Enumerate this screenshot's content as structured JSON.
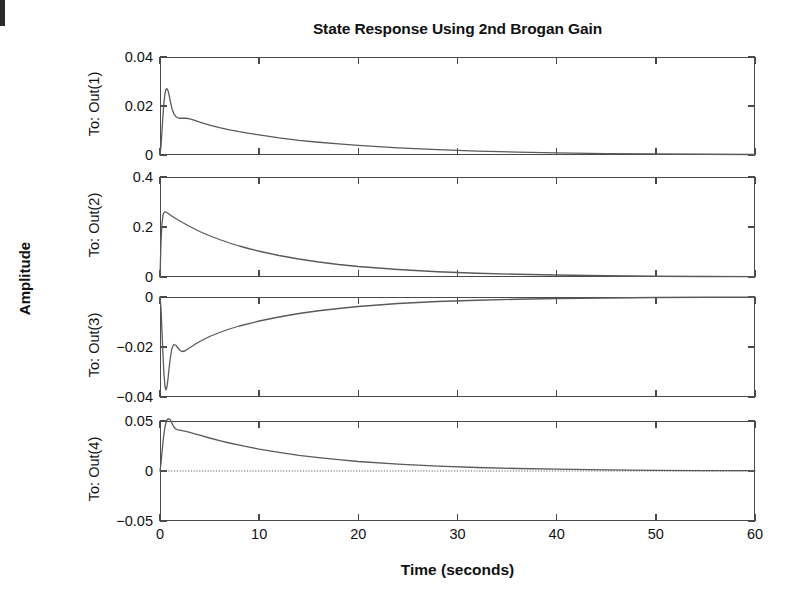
{
  "figure": {
    "title": "State Response Using 2nd Brogan Gain",
    "ylabel": "Amplitude",
    "xlabel": "Time (seconds)"
  },
  "chart_data": {
    "type": "line",
    "title": "State Response Using 2nd Brogan Gain",
    "xlabel": "Time (seconds)",
    "ylabel": "Amplitude",
    "xlim": [
      0,
      60
    ],
    "xticks": [
      0,
      10,
      20,
      30,
      40,
      50,
      60
    ],
    "xticklabels": [
      "0",
      "10",
      "20",
      "30",
      "40",
      "50",
      "60"
    ],
    "grid": false,
    "legend": null,
    "line_color": "#5a5a5a",
    "subplots": [
      {
        "name": "To: Out(1)",
        "ylabel": "To: Out(1)",
        "ylim": [
          0,
          0.04
        ],
        "yticks": [
          0,
          0.02,
          0.04
        ],
        "yticklabels": [
          "0",
          "0.02",
          "0.04"
        ],
        "zero_line": false,
        "x": [
          0,
          0.1,
          0.2,
          0.3,
          0.4,
          0.5,
          0.6,
          0.7,
          0.8,
          0.9,
          1.0,
          1.2,
          1.4,
          1.6,
          1.8,
          2.0,
          2.2,
          2.4,
          2.6,
          2.8,
          3.0,
          3.5,
          4.0,
          5.0,
          6.0,
          7.0,
          8.0,
          9.0,
          10.0,
          12.0,
          14.0,
          16.0,
          18.0,
          20.0,
          24.0,
          28.0,
          32.0,
          36.0,
          40.0,
          45.0,
          50.0,
          55.0,
          60.0
        ],
        "y": [
          0.0,
          0.0035,
          0.0098,
          0.0163,
          0.0215,
          0.0251,
          0.0268,
          0.0271,
          0.0264,
          0.0248,
          0.0228,
          0.019,
          0.0168,
          0.0157,
          0.0152,
          0.015,
          0.015,
          0.015,
          0.015,
          0.0149,
          0.0147,
          0.0141,
          0.0134,
          0.0122,
          0.0112,
          0.0103,
          0.0095,
          0.0088,
          0.0082,
          0.007,
          0.006,
          0.0052,
          0.0045,
          0.0039,
          0.0029,
          0.0022,
          0.0016,
          0.0012,
          0.0009,
          0.0006,
          0.0004,
          0.0003,
          0.0002
        ]
      },
      {
        "name": "To: Out(2)",
        "ylabel": "To: Out(2)",
        "ylim": [
          0,
          0.4
        ],
        "yticks": [
          0,
          0.2,
          0.4
        ],
        "yticklabels": [
          "0",
          "0.2",
          "0.4"
        ],
        "zero_line": false,
        "x": [
          0,
          0.1,
          0.2,
          0.3,
          0.4,
          0.5,
          0.7,
          0.9,
          1.0,
          1.5,
          2.0,
          2.5,
          3.0,
          3.5,
          4.0,
          5.0,
          6.0,
          7.0,
          8.0,
          9.0,
          10.0,
          12.0,
          14.0,
          16.0,
          18.0,
          20.0,
          24.0,
          28.0,
          32.0,
          36.0,
          40.0,
          45.0,
          50.0,
          55.0,
          60.0
        ],
        "y": [
          0.0,
          0.14,
          0.215,
          0.248,
          0.258,
          0.261,
          0.258,
          0.252,
          0.249,
          0.236,
          0.224,
          0.213,
          0.202,
          0.192,
          0.182,
          0.165,
          0.15,
          0.136,
          0.124,
          0.113,
          0.103,
          0.086,
          0.072,
          0.06,
          0.05,
          0.042,
          0.03,
          0.021,
          0.015,
          0.011,
          0.008,
          0.005,
          0.003,
          0.002,
          0.0012
        ]
      },
      {
        "name": "To: Out(3)",
        "ylabel": "To: Out(3)",
        "ylim": [
          -0.04,
          0
        ],
        "yticks": [
          0,
          -0.02,
          -0.04
        ],
        "yticklabels": [
          "0",
          "−0.02",
          "−0.04"
        ],
        "zero_line": false,
        "x": [
          0,
          0.1,
          0.2,
          0.3,
          0.4,
          0.5,
          0.6,
          0.7,
          0.8,
          0.9,
          1.0,
          1.2,
          1.4,
          1.6,
          1.8,
          2.0,
          2.2,
          2.5,
          2.8,
          3.0,
          3.5,
          4.0,
          5.0,
          6.0,
          7.0,
          8.0,
          10.0,
          12.0,
          14.0,
          16.0,
          18.0,
          20.0,
          24.0,
          28.0,
          32.0,
          36.0,
          40.0,
          45.0,
          50.0,
          55.0,
          60.0
        ],
        "y": [
          0.0,
          -0.0045,
          -0.0135,
          -0.0232,
          -0.031,
          -0.0357,
          -0.0372,
          -0.036,
          -0.033,
          -0.0292,
          -0.0255,
          -0.0205,
          -0.019,
          -0.0193,
          -0.0203,
          -0.0213,
          -0.0218,
          -0.0216,
          -0.0208,
          -0.0203,
          -0.019,
          -0.0178,
          -0.0158,
          -0.0142,
          -0.0128,
          -0.0116,
          -0.0096,
          -0.008,
          -0.0066,
          -0.0055,
          -0.0046,
          -0.0038,
          -0.0026,
          -0.0018,
          -0.0013,
          -0.0009,
          -0.0006,
          -0.0004,
          -0.0002,
          -0.0001,
          -5e-05
        ]
      },
      {
        "name": "To: Out(4)",
        "ylabel": "To: Out(4)",
        "ylim": [
          -0.05,
          0.05
        ],
        "yticks": [
          0.05,
          0,
          -0.05
        ],
        "yticklabels": [
          "0.05",
          "0",
          "−0.05"
        ],
        "zero_line": true,
        "x": [
          0,
          0.1,
          0.2,
          0.3,
          0.4,
          0.5,
          0.6,
          0.7,
          0.8,
          0.9,
          1.0,
          1.1,
          1.2,
          1.4,
          1.6,
          1.8,
          2.0,
          2.2,
          2.5,
          3.0,
          3.5,
          4.0,
          5.0,
          6.0,
          7.0,
          8.0,
          9.0,
          10.0,
          12.0,
          14.0,
          16.0,
          18.0,
          20.0,
          24.0,
          28.0,
          32.0,
          36.0,
          40.0,
          45.0,
          50.0,
          55.0,
          60.0
        ],
        "y": [
          0.0,
          0.0075,
          0.0185,
          0.029,
          0.0375,
          0.044,
          0.0483,
          0.0508,
          0.052,
          0.0522,
          0.0516,
          0.05,
          0.048,
          0.044,
          0.042,
          0.0412,
          0.0408,
          0.0404,
          0.0398,
          0.0386,
          0.0372,
          0.0358,
          0.033,
          0.0304,
          0.028,
          0.0258,
          0.0238,
          0.0219,
          0.0186,
          0.0157,
          0.0133,
          0.0113,
          0.0095,
          0.0068,
          0.0049,
          0.0035,
          0.0025,
          0.0018,
          0.0011,
          0.0007,
          0.0004,
          0.0003
        ]
      }
    ]
  }
}
